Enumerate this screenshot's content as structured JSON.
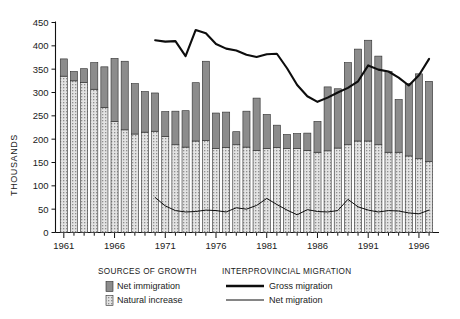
{
  "chart_data": {
    "type": "bar",
    "title": "",
    "xlabel": "",
    "ylabel": "THOUSANDS",
    "ylim": [
      0,
      450
    ],
    "ytick_step": 50,
    "yticks": [
      0,
      50,
      100,
      150,
      200,
      250,
      300,
      350,
      400,
      450
    ],
    "grid": false,
    "stacked": true,
    "categories": [
      1961,
      1962,
      1963,
      1964,
      1965,
      1966,
      1967,
      1968,
      1969,
      1970,
      1971,
      1972,
      1973,
      1974,
      1975,
      1976,
      1977,
      1978,
      1979,
      1980,
      1981,
      1982,
      1983,
      1984,
      1985,
      1986,
      1987,
      1988,
      1989,
      1990,
      1991,
      1992,
      1993,
      1994,
      1995,
      1996,
      1997
    ],
    "xtick_labels": [
      "1961",
      "1966",
      "1971",
      "1976",
      "1981",
      "1986",
      "1991",
      "1996"
    ],
    "xtick_years": [
      1961,
      1966,
      1971,
      1976,
      1981,
      1986,
      1991,
      1996
    ],
    "series": [
      {
        "name": "Natural increase",
        "color": "#c9c9c9",
        "pattern": "dotted",
        "values": [
          335,
          325,
          321,
          307,
          268,
          238,
          220,
          211,
          215,
          217,
          206,
          188,
          183,
          196,
          197,
          180,
          182,
          188,
          183,
          176,
          180,
          182,
          180,
          180,
          176,
          172,
          175,
          181,
          188,
          196,
          196,
          188,
          172,
          172,
          164,
          158,
          152
        ]
      },
      {
        "name": "Net immigration",
        "color": "#8c8c8c",
        "pattern": "solid",
        "values": [
          37,
          20,
          30,
          57,
          87,
          135,
          147,
          108,
          87,
          82,
          53,
          72,
          78,
          125,
          170,
          76,
          76,
          28,
          77,
          112,
          73,
          48,
          30,
          32,
          37,
          66,
          137,
          127,
          176,
          197,
          216,
          190,
          173,
          113,
          155,
          182,
          172
        ]
      }
    ],
    "stack_totals": [
      372,
      345,
      351,
      364,
      355,
      373,
      367,
      319,
      302,
      299,
      259,
      260,
      261,
      321,
      367,
      256,
      258,
      216,
      260,
      288,
      253,
      230,
      210,
      212,
      213,
      238,
      312,
      308,
      364,
      393,
      412,
      378,
      345,
      285,
      319,
      340,
      324
    ],
    "lines": [
      {
        "name": "Gross migration",
        "color": "#0d0d0d",
        "width": "thick",
        "x": [
          1970,
          1971,
          1972,
          1973,
          1974,
          1975,
          1976,
          1977,
          1978,
          1979,
          1980,
          1981,
          1982,
          1983,
          1984,
          1985,
          1986,
          1987,
          1988,
          1989,
          1990,
          1991,
          1992,
          1993,
          1994,
          1995,
          1996,
          1997
        ],
        "values": [
          412,
          409,
          410,
          378,
          434,
          427,
          404,
          394,
          390,
          381,
          376,
          382,
          383,
          352,
          316,
          292,
          280,
          289,
          300,
          310,
          324,
          358,
          349,
          345,
          332,
          315,
          337,
          372
        ]
      },
      {
        "name": "Net migration",
        "color": "#0d0d0d",
        "width": "thin",
        "x": [
          1970,
          1971,
          1972,
          1973,
          1974,
          1975,
          1976,
          1977,
          1978,
          1979,
          1980,
          1981,
          1982,
          1983,
          1984,
          1985,
          1986,
          1987,
          1988,
          1989,
          1990,
          1991,
          1992,
          1993,
          1994,
          1995,
          1996,
          1997
        ],
        "values": [
          75,
          57,
          47,
          44,
          45,
          48,
          47,
          44,
          53,
          50,
          58,
          73,
          60,
          48,
          38,
          49,
          45,
          44,
          47,
          71,
          55,
          48,
          44,
          47,
          46,
          42,
          40,
          48
        ]
      }
    ]
  },
  "legend": {
    "group1": {
      "title": "SOURCES OF GROWTH",
      "items": [
        {
          "label": "Net immigration",
          "swatch": "solid-gray"
        },
        {
          "label": "Natural increase",
          "swatch": "dotted-light"
        }
      ]
    },
    "group2": {
      "title": "INTERPROVINCIAL MIGRATION",
      "items": [
        {
          "label": "Gross migration",
          "swatch": "thick-line"
        },
        {
          "label": "Net migration",
          "swatch": "thin-line"
        }
      ]
    }
  }
}
